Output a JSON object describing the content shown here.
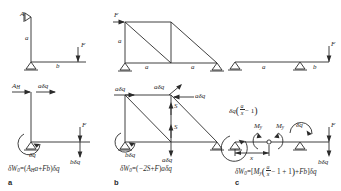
{
  "figure": {
    "caption_letters": [
      "a",
      "b",
      "c"
    ],
    "stroke_color": "#2b2b2b",
    "background": "#ffffff"
  },
  "panel_a": {
    "letter": "a",
    "top_diagram": {
      "name": "bent-cantilever-frame",
      "labels": {
        "pin_top": "A",
        "vertical_member": "a",
        "horizontal_member": "b",
        "applied_force": "F"
      }
    },
    "bottom_diagram": {
      "name": "virtual-displacement-frame",
      "labels": {
        "reaction": "A",
        "reaction_sub": "H",
        "top_displacement": "aδq",
        "rotation": "δq",
        "force": "F",
        "force_displacement": "bδq"
      }
    },
    "equation": {
      "lhs": "δW",
      "lhs_sub": "0",
      "eq": "=",
      "open": "(",
      "term1": "A",
      "term1_sub": "H",
      "term1_var": "a",
      "plus": "+",
      "term2": "Fb",
      "close": ")",
      "tail": "δq"
    }
  },
  "panel_b": {
    "letter": "b",
    "top_diagram": {
      "name": "truss-two-bay",
      "labels": {
        "applied_force": "F",
        "height": "a",
        "bay1": "a",
        "bay2": "a"
      }
    },
    "bottom_diagram": {
      "name": "truss-virtual-displacement",
      "labels": {
        "top_left_disp": "aδq",
        "top_mid_disp": "aδq",
        "top_right_disp": "aδq",
        "bar_force_upper": "S",
        "bar_force_lower": "S",
        "rotation": "δq",
        "support_disp": "bδq",
        "bottom_disp": "aδq"
      }
    },
    "equation": {
      "lhs": "δW",
      "lhs_sub": "0",
      "eq": "=",
      "open": "(",
      "term1": "−2S",
      "plus": "+",
      "term2": "F",
      "close": ")",
      "tail": "aδq"
    }
  },
  "panel_c": {
    "letter": "c",
    "top_diagram": {
      "name": "simply-supported-beam-overhang",
      "labels": {
        "span": "a",
        "overhang": "b",
        "applied_force": "F"
      }
    },
    "bottom_diagram": {
      "name": "beam-hinge-virtual-displacement",
      "labels": {
        "left_rotation_num": "a",
        "left_rotation_den": "x",
        "left_rotation_prefix": "δq",
        "left_rotation_minus": "− 1",
        "moment_left": "M",
        "moment_left_sub": "y",
        "moment_right": "M",
        "moment_right_sub": "y",
        "rotation": "δq",
        "dimension_x": "x",
        "force": "F",
        "force_displacement": "bδq"
      }
    },
    "equation": {
      "lhs": "δW",
      "lhs_sub": "0",
      "eq": "=",
      "open": "[",
      "term1": "M",
      "term1_sub": "y",
      "fnum": "a",
      "fden": "x",
      "inner_tail": "− 1 + 1",
      "plus": "+",
      "term2": "Fb",
      "close": "]",
      "tail": "δq"
    }
  }
}
